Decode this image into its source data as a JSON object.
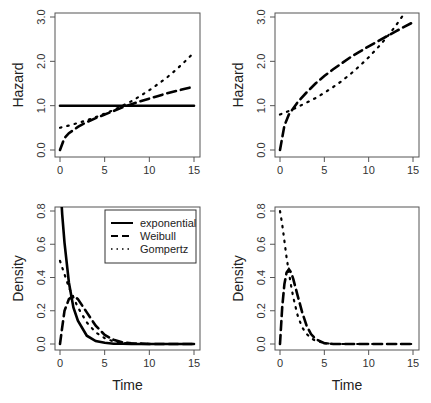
{
  "chart_data": [
    {
      "type": "line",
      "panel": "top-left",
      "title": "",
      "xlabel": "",
      "ylabel": "Hazard",
      "xlim": [
        0,
        15
      ],
      "ylim": [
        0,
        3
      ],
      "xticks": [
        "0",
        "5",
        "10",
        "15"
      ],
      "yticks": [
        "0.0",
        "1.0",
        "2.0",
        "3.0"
      ],
      "grid": false,
      "x": [
        0,
        0.5,
        1,
        2,
        3,
        4,
        5,
        6,
        7,
        8,
        9,
        10,
        11,
        12,
        13,
        14,
        15
      ],
      "series": [
        {
          "name": "exponential",
          "style": "solid",
          "values": [
            1.0,
            1.0,
            1.0,
            1.0,
            1.0,
            1.0,
            1.0,
            1.0,
            1.0,
            1.0,
            1.0,
            1.0,
            1.0,
            1.0,
            1.0,
            1.0,
            1.0
          ]
        },
        {
          "name": "Weibull",
          "style": "dashed",
          "values": [
            0.0,
            0.27,
            0.38,
            0.52,
            0.63,
            0.72,
            0.8,
            0.88,
            0.96,
            1.03,
            1.1,
            1.16,
            1.22,
            1.28,
            1.33,
            1.38,
            1.43
          ]
        },
        {
          "name": "Gompertz",
          "style": "dotted",
          "values": [
            0.5,
            0.53,
            0.55,
            0.61,
            0.67,
            0.74,
            0.82,
            0.9,
            1.0,
            1.1,
            1.22,
            1.35,
            1.49,
            1.64,
            1.81,
            2.0,
            2.2
          ]
        }
      ]
    },
    {
      "type": "line",
      "panel": "top-right",
      "title": "",
      "xlabel": "",
      "ylabel": "Hazard",
      "xlim": [
        0,
        15
      ],
      "ylim": [
        0,
        3
      ],
      "xticks": [
        "0",
        "5",
        "10",
        "15"
      ],
      "yticks": [
        "0.0",
        "1.0",
        "2.0",
        "3.0"
      ],
      "grid": false,
      "x": [
        0,
        0.5,
        1,
        2,
        3,
        4,
        5,
        6,
        7,
        8,
        9,
        10,
        11,
        12,
        13,
        14,
        15
      ],
      "series": [
        {
          "name": "Weibull",
          "style": "dashed",
          "values": [
            0.0,
            0.55,
            0.8,
            1.08,
            1.3,
            1.5,
            1.67,
            1.82,
            1.96,
            2.1,
            2.22,
            2.34,
            2.45,
            2.56,
            2.67,
            2.78,
            2.88
          ]
        },
        {
          "name": "Gompertz",
          "style": "dotted",
          "values": [
            0.8,
            0.84,
            0.88,
            0.97,
            1.07,
            1.17,
            1.29,
            1.42,
            1.56,
            1.72,
            1.9,
            2.09,
            2.3,
            2.53,
            2.79,
            3.07,
            3.38
          ]
        }
      ]
    },
    {
      "type": "line",
      "panel": "bottom-left",
      "title": "",
      "xlabel": "Time",
      "ylabel": "Density",
      "xlim": [
        0,
        15
      ],
      "ylim": [
        0,
        0.8
      ],
      "xticks": [
        "0",
        "5",
        "10",
        "15"
      ],
      "yticks": [
        "0.0",
        "0.2",
        "0.4",
        "0.6",
        "0.8"
      ],
      "grid": false,
      "legend": {
        "position": "top-right",
        "entries": [
          {
            "label": "exponential",
            "style": "solid"
          },
          {
            "label": "Weibull",
            "style": "dashed"
          },
          {
            "label": "Gompertz",
            "style": "dotted"
          }
        ]
      },
      "x": [
        0,
        0.25,
        0.5,
        1,
        1.5,
        2,
        3,
        4,
        5,
        6,
        7,
        8,
        10,
        12,
        15
      ],
      "series": [
        {
          "name": "exponential",
          "style": "solid",
          "values": [
            1.0,
            0.78,
            0.61,
            0.37,
            0.22,
            0.14,
            0.05,
            0.018,
            0.007,
            0.002,
            0.001,
            0.0,
            0.0,
            0.0,
            0.0
          ]
        },
        {
          "name": "Weibull",
          "style": "dashed",
          "values": [
            0.0,
            0.1,
            0.2,
            0.27,
            0.29,
            0.27,
            0.19,
            0.11,
            0.055,
            0.025,
            0.01,
            0.004,
            0.0,
            0.0,
            0.0
          ]
        },
        {
          "name": "Gompertz",
          "style": "dotted",
          "values": [
            0.5,
            0.46,
            0.42,
            0.34,
            0.28,
            0.22,
            0.13,
            0.07,
            0.035,
            0.015,
            0.006,
            0.002,
            0.0,
            0.0,
            0.0
          ]
        }
      ]
    },
    {
      "type": "line",
      "panel": "bottom-right",
      "title": "",
      "xlabel": "Time",
      "ylabel": "Density",
      "xlim": [
        0,
        15
      ],
      "ylim": [
        0,
        0.8
      ],
      "xticks": [
        "0",
        "5",
        "10",
        "15"
      ],
      "yticks": [
        "0.0",
        "0.2",
        "0.4",
        "0.6",
        "0.8"
      ],
      "grid": false,
      "x": [
        0,
        0.25,
        0.5,
        0.75,
        1,
        1.25,
        1.5,
        2,
        2.5,
        3,
        3.5,
        4,
        5,
        6,
        8,
        10,
        15
      ],
      "series": [
        {
          "name": "Weibull",
          "style": "dashed",
          "values": [
            0.0,
            0.22,
            0.36,
            0.43,
            0.45,
            0.43,
            0.39,
            0.29,
            0.19,
            0.11,
            0.06,
            0.03,
            0.005,
            0.0,
            0.0,
            0.0,
            0.0
          ]
        },
        {
          "name": "Gompertz",
          "style": "dotted",
          "values": [
            0.8,
            0.72,
            0.62,
            0.52,
            0.43,
            0.35,
            0.28,
            0.17,
            0.1,
            0.06,
            0.035,
            0.02,
            0.006,
            0.0,
            0.0,
            0.0,
            0.0
          ]
        }
      ]
    }
  ],
  "labels": {
    "hazard": "Hazard",
    "density": "Density",
    "time": "Time"
  }
}
